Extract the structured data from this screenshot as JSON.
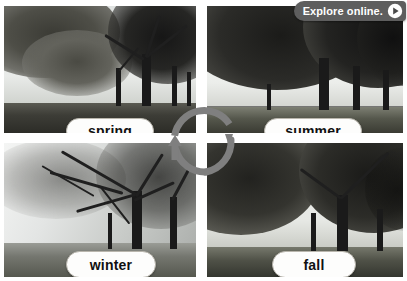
{
  "page": {
    "width": 407,
    "height": 281
  },
  "badge": {
    "label": "Explore online.",
    "icon": "play-icon",
    "background_color": "#5e5e5e",
    "text_color": "#ffffff"
  },
  "panels": [
    {
      "id": "spring",
      "label": "spring",
      "position": "top-left",
      "scene": "Row of trees with light leafy canopy on the left, dark trunks at right, open field and bright hazy sky"
    },
    {
      "id": "summer",
      "label": "summer",
      "position": "top-right",
      "scene": "Dense dark full-leaf canopy filling the frame above a bright grassy field"
    },
    {
      "id": "winter",
      "label": "winter",
      "position": "bottom-left",
      "scene": "Bare frost-covered branches over a misty pale field"
    },
    {
      "id": "fall",
      "label": "fall",
      "position": "bottom-right",
      "scene": "Trees with thinning dark foliage over a dry open field"
    }
  ],
  "cycle": {
    "type": "cycle-diagram",
    "direction": "clockwise",
    "arrow_color": "#7f7f7f",
    "steps": [
      "spring",
      "summer",
      "fall",
      "winter"
    ],
    "arrows": [
      {
        "id": "spring-to-summer",
        "from": "spring",
        "to": "summer",
        "head": "down-right"
      },
      {
        "id": "summer-to-fall",
        "from": "summer",
        "to": "fall",
        "head": "down"
      },
      {
        "id": "fall-to-winter",
        "from": "fall",
        "to": "winter",
        "head": "left"
      },
      {
        "id": "winter-to-spring",
        "from": "winter",
        "to": "spring",
        "head": "up"
      }
    ]
  },
  "colors": {
    "label_background": "#fdfdfc",
    "label_border": "#b9b6ad",
    "label_text": "#111111",
    "page_background": "#ffffff"
  }
}
